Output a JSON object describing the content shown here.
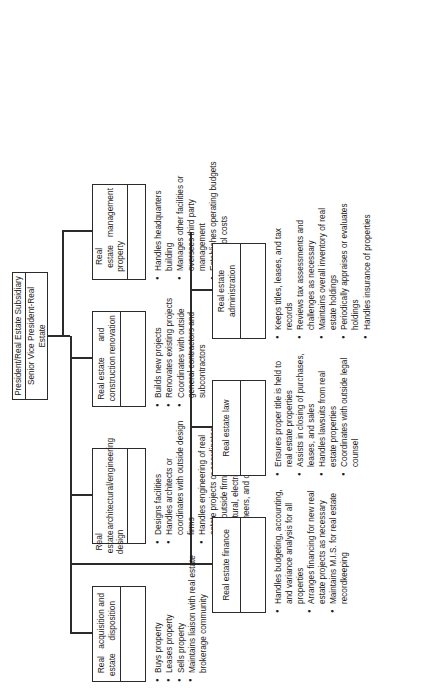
{
  "chart_title": "Real estate organization chart",
  "header": {
    "rows": [
      "President/Real Estate Subsidiary",
      "Senior Vice President-Real Estate"
    ]
  },
  "units": [
    {
      "id": "acquisition",
      "title": "Real estate\nacquisition and disposition",
      "title_line1": "Real estate",
      "title_line2": "acquisition and disposition",
      "bullets": [
        "Buys property",
        "Leases property",
        "Sells property",
        "Maintains liaison with real estate brokerage community"
      ]
    },
    {
      "id": "design",
      "title_line1": "Real estate design",
      "title_line2": "architectural/engineering",
      "bullets": [
        "Designs facilities",
        "Handles architects or coordinates with outside design firms",
        "Handles engineering of real estate projects or coordinates with outside firms, including civil, structural, electrical, mechanical engineers, and others"
      ]
    },
    {
      "id": "construction",
      "title_line1": "Real estate construction",
      "title_line2": "and renovation",
      "bullets": [
        "Builds new projects",
        "Renovates existing projects",
        "Coordinates with outside general contractors and subcontractors"
      ]
    },
    {
      "id": "property-management",
      "title_line1": "Real estate property",
      "title_line2": "management",
      "bullets": [
        "Handles headquarters building",
        "Manages other facilities or oversees third party management",
        "Establishes operating budgets to control costs"
      ]
    },
    {
      "id": "finance",
      "title_line1": "Real estate finance",
      "title_line2": "",
      "bullets": [
        "Handles budgeting, accounting, and variance analysis for all properties",
        "Arranges financing for new real estate projects as necessary",
        "Maintains M.I.S. for real estate recordkeeping"
      ]
    },
    {
      "id": "law",
      "title_line1": "Real estate law",
      "title_line2": "",
      "bullets": [
        "Ensures proper title is held to real estate properties",
        "Assists in closing of purchases, leases, and sales",
        "Handles lawsuits from real estate properties",
        "Coordinates with outside legal counsel"
      ]
    },
    {
      "id": "administration",
      "title_line1": "Real estate administration",
      "title_line2": "",
      "bullets": [
        "Keeps titles, leases, and tax records",
        "Reviews tax assessments and challenges as necessary",
        "Maintains overall inventory of real estate holdings",
        "Periodically appraises or evaluates holdings",
        "Handles insurance of properties"
      ]
    }
  ],
  "colors": {
    "line": "#2b2b2b",
    "background": "#ffffff",
    "text": "#1a1a1a"
  }
}
